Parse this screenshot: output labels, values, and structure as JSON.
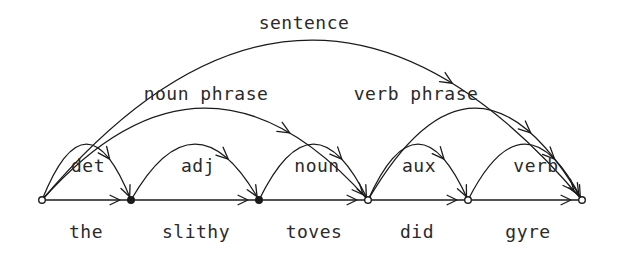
{
  "diagram": {
    "kind": "parse-chart-arc-diagram",
    "title_label": "sentence",
    "background_color": "#ffffff",
    "ink_color": "#1a1a1a",
    "words": [
      {
        "text": "the",
        "center_x": 86,
        "y": 231
      },
      {
        "text": "slithy",
        "center_x": 196,
        "y": 231
      },
      {
        "text": "toves",
        "center_x": 314,
        "y": 231
      },
      {
        "text": "did",
        "center_x": 417,
        "y": 231
      },
      {
        "text": "gyre",
        "center_x": 528,
        "y": 231
      }
    ],
    "nodes": [
      {
        "index": 0,
        "x": 42,
        "y": 200,
        "filled": false
      },
      {
        "index": 1,
        "x": 131,
        "y": 200,
        "filled": true
      },
      {
        "index": 2,
        "x": 259,
        "y": 200,
        "filled": true
      },
      {
        "index": 3,
        "x": 368,
        "y": 200,
        "filled": false
      },
      {
        "index": 4,
        "x": 468,
        "y": 200,
        "filled": false
      },
      {
        "index": 5,
        "x": 582,
        "y": 200,
        "filled": false
      }
    ],
    "baseline": {
      "x1": 42,
      "x2": 582,
      "y": 200
    },
    "baseline_arrow_x": [
      120,
      248,
      357,
      457,
      571
    ],
    "arcs": [
      {
        "label": "det",
        "from": 0,
        "to": 1,
        "level": 1,
        "peak_y": 144,
        "label_x": 88,
        "label_y": 165
      },
      {
        "label": "adj",
        "from": 1,
        "to": 2,
        "level": 1,
        "peak_y": 144,
        "label_x": 198,
        "label_y": 165
      },
      {
        "label": "noun",
        "from": 2,
        "to": 3,
        "level": 1,
        "peak_y": 144,
        "label_x": 317,
        "label_y": 165
      },
      {
        "label": "aux",
        "from": 3,
        "to": 4,
        "level": 1,
        "peak_y": 144,
        "label_x": 419,
        "label_y": 165
      },
      {
        "label": "verb",
        "from": 4,
        "to": 5,
        "level": 1,
        "peak_y": 144,
        "label_x": 536,
        "label_y": 165
      },
      {
        "label": "noun phrase",
        "from": 0,
        "to": 3,
        "level": 2,
        "peak_y": 108,
        "label_x": 206,
        "label_y": 93
      },
      {
        "label": "verb phrase",
        "from": 3,
        "to": 5,
        "level": 2,
        "peak_y": 108,
        "label_x": 416,
        "label_y": 93
      },
      {
        "label": "sentence",
        "from": 0,
        "to": 5,
        "level": 3,
        "peak_y": 40,
        "label_x": 304,
        "label_y": 22
      }
    ],
    "parse": {
      "sentence": "the slithy toves did gyre",
      "structure": "sentence -> noun phrase ( det adj noun ) verb phrase ( aux verb )"
    }
  }
}
